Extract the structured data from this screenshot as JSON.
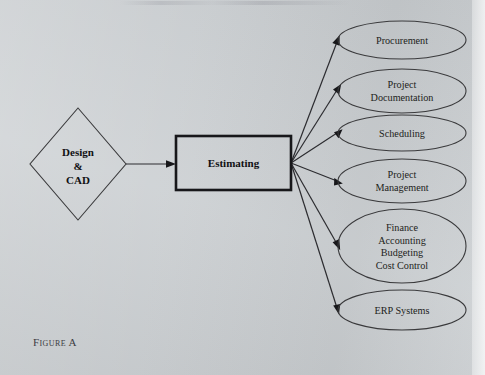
{
  "figure": {
    "caption": "Figure A",
    "background_color": "#c9cdd0",
    "line_color": "#2c2c30"
  },
  "diagram": {
    "type": "flow-diagram",
    "source_node": {
      "shape": "diamond",
      "lines": [
        "Design",
        "&",
        "CAD"
      ],
      "bold": true,
      "cx": 78,
      "cy": 164,
      "rx": 48,
      "ry": 56
    },
    "process_node": {
      "shape": "rectangle",
      "label": "Estimating",
      "bold": true,
      "x": 176,
      "y": 136,
      "width": 115,
      "height": 54
    },
    "fan_origin": {
      "x": 291,
      "y": 163
    },
    "output_nodes": [
      {
        "shape": "ellipse",
        "lines": [
          "Procurement"
        ],
        "cx": 402,
        "cy": 40,
        "rx": 64,
        "ry": 19
      },
      {
        "shape": "ellipse",
        "lines": [
          "Project",
          "Documentation"
        ],
        "cx": 402,
        "cy": 91,
        "rx": 64,
        "ry": 22
      },
      {
        "shape": "ellipse",
        "lines": [
          "Scheduling"
        ],
        "cx": 402,
        "cy": 133,
        "rx": 64,
        "ry": 18
      },
      {
        "shape": "ellipse",
        "lines": [
          "Project",
          "Management"
        ],
        "cx": 402,
        "cy": 181,
        "rx": 64,
        "ry": 22
      },
      {
        "shape": "ellipse",
        "lines": [
          "Finance",
          "Accounting",
          "Budgeting",
          "Cost Control"
        ],
        "cx": 402,
        "cy": 246,
        "rx": 64,
        "ry": 37
      },
      {
        "shape": "ellipse",
        "lines": [
          "ERP Systems"
        ],
        "cx": 402,
        "cy": 310,
        "rx": 64,
        "ry": 20
      }
    ],
    "connectors": [
      {
        "from": "source_node",
        "to": "process_node",
        "style": "arrow"
      },
      {
        "from": "process_node",
        "to": "Procurement",
        "style": "arrow"
      },
      {
        "from": "process_node",
        "to": "Project Documentation",
        "style": "arrow"
      },
      {
        "from": "process_node",
        "to": "Scheduling",
        "style": "arrow"
      },
      {
        "from": "process_node",
        "to": "Project Management",
        "style": "arrow"
      },
      {
        "from": "process_node",
        "to": "Finance Accounting Budgeting Cost Control",
        "style": "arrow"
      },
      {
        "from": "process_node",
        "to": "ERP Systems",
        "style": "arrow"
      }
    ]
  }
}
